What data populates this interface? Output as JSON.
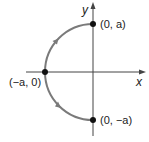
{
  "diagram": {
    "type": "parametric-curve",
    "axes": {
      "x_label": "x",
      "y_label": "y"
    },
    "points": [
      {
        "id": "top",
        "label": "(0, a)"
      },
      {
        "id": "left",
        "label": "(−a, 0)"
      },
      {
        "id": "bottom",
        "label": "(0, −a)"
      }
    ],
    "curve": {
      "shape": "semicircle",
      "side": "left",
      "direction": "bottom-to-top",
      "color": "#7a7a7a"
    },
    "colors": {
      "axis": "#444444",
      "point": "#111111",
      "curve": "#7a7a7a"
    }
  }
}
